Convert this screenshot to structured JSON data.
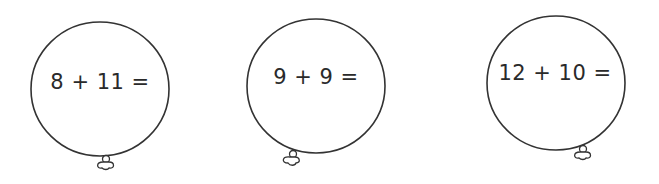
{
  "worksheet": {
    "balloons": [
      {
        "equation": "8 + 11 =",
        "cx": 100,
        "cy": 89,
        "rx": 69,
        "ry": 67,
        "text_x": 100,
        "text_y": 82,
        "knot_x": 106,
        "knot_y": 156,
        "knot_dx": 0
      },
      {
        "equation": "9 + 9 =",
        "cx": 316,
        "cy": 86,
        "rx": 69,
        "ry": 67,
        "text_x": 316,
        "text_y": 77,
        "knot_x": 292,
        "knot_y": 151,
        "knot_dx": -4
      },
      {
        "equation": "12 + 10 =",
        "cx": 556,
        "cy": 83,
        "rx": 69,
        "ry": 67,
        "text_x": 555,
        "text_y": 73,
        "knot_x": 583,
        "knot_y": 146,
        "knot_dx": 0
      }
    ],
    "colors": {
      "stroke": "#333333",
      "text": "#2a2a2a",
      "background": "#ffffff"
    }
  }
}
